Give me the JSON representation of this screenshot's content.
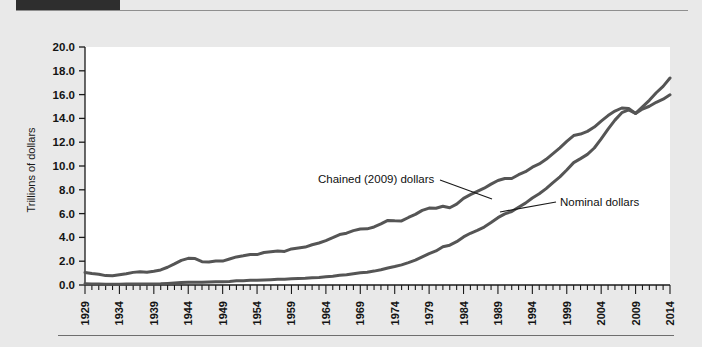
{
  "page": {
    "background_color": "#e9e9e9",
    "header_bar_color": "#2e2e2e",
    "rule_color": "#6e6e6e"
  },
  "chart_data": {
    "type": "line",
    "title": "",
    "subtitle": "",
    "xlabel": "",
    "ylabel": "Trillions of dollars",
    "xlim": [
      1929,
      2014
    ],
    "ylim": [
      0.0,
      20.0
    ],
    "ytick_step": 2.0,
    "xtick_step": 1,
    "xtick_label_step": 5,
    "grid": false,
    "legend_position": "inline-annotations",
    "plot_background": "#ffffff",
    "line_color": "#555555",
    "line_width": 3,
    "ytick_labels": [
      "0.0",
      "2.0",
      "4.0",
      "6.0",
      "8.0",
      "10.0",
      "12.0",
      "14.0",
      "16.0",
      "18.0",
      "20.0"
    ],
    "xtick_labels": [
      "1929",
      "1934",
      "1939",
      "1944",
      "1949",
      "1954",
      "1959",
      "1964",
      "1969",
      "1974",
      "1979",
      "1984",
      "1989",
      "1994",
      "1999",
      "2004",
      "2009",
      "2014"
    ],
    "annotations": [
      {
        "text": "Chained (2009) dollars",
        "x": 318,
        "y": 183,
        "leader": [
          [
            440,
            180
          ],
          [
            492,
            199
          ]
        ]
      },
      {
        "text": "Nominal dollars",
        "x": 560,
        "y": 206,
        "leader": [
          [
            556,
            202
          ],
          [
            500,
            212
          ]
        ]
      }
    ],
    "x": [
      1929,
      1930,
      1931,
      1932,
      1933,
      1934,
      1935,
      1936,
      1937,
      1938,
      1939,
      1940,
      1941,
      1942,
      1943,
      1944,
      1945,
      1946,
      1947,
      1948,
      1949,
      1950,
      1951,
      1952,
      1953,
      1954,
      1955,
      1956,
      1957,
      1958,
      1959,
      1960,
      1961,
      1962,
      1963,
      1964,
      1965,
      1966,
      1967,
      1968,
      1969,
      1970,
      1971,
      1972,
      1973,
      1974,
      1975,
      1976,
      1977,
      1978,
      1979,
      1980,
      1981,
      1982,
      1983,
      1984,
      1985,
      1986,
      1987,
      1988,
      1989,
      1990,
      1991,
      1992,
      1993,
      1994,
      1995,
      1996,
      1997,
      1998,
      1999,
      2000,
      2001,
      2002,
      2003,
      2004,
      2005,
      2006,
      2007,
      2008,
      2009,
      2010,
      2011,
      2012,
      2013,
      2014
    ],
    "series": [
      {
        "name": "Chained (2009) dollars",
        "values": [
          1.057,
          0.967,
          0.905,
          0.788,
          0.778,
          0.862,
          0.939,
          1.061,
          1.115,
          1.077,
          1.163,
          1.266,
          1.49,
          1.771,
          2.072,
          2.239,
          2.217,
          1.961,
          1.939,
          2.02,
          2.009,
          2.184,
          2.36,
          2.456,
          2.571,
          2.556,
          2.734,
          2.794,
          2.849,
          2.823,
          3.03,
          3.109,
          3.189,
          3.384,
          3.532,
          3.735,
          3.977,
          4.238,
          4.355,
          4.566,
          4.71,
          4.718,
          4.878,
          5.134,
          5.424,
          5.396,
          5.385,
          5.675,
          5.937,
          6.267,
          6.466,
          6.45,
          6.617,
          6.491,
          6.792,
          7.285,
          7.594,
          7.861,
          8.133,
          8.475,
          8.786,
          8.955,
          8.948,
          9.267,
          9.521,
          9.905,
          10.175,
          10.561,
          11.035,
          11.526,
          12.066,
          12.56,
          12.682,
          12.909,
          13.271,
          13.774,
          14.234,
          14.614,
          14.874,
          14.83,
          14.419,
          14.784,
          15.021,
          15.355,
          15.612,
          15.983
        ]
      },
      {
        "name": "Nominal dollars",
        "values": [
          0.105,
          0.092,
          0.077,
          0.06,
          0.057,
          0.067,
          0.074,
          0.085,
          0.093,
          0.087,
          0.093,
          0.103,
          0.129,
          0.166,
          0.203,
          0.224,
          0.228,
          0.228,
          0.25,
          0.275,
          0.273,
          0.3,
          0.347,
          0.367,
          0.389,
          0.391,
          0.426,
          0.45,
          0.474,
          0.482,
          0.522,
          0.543,
          0.563,
          0.605,
          0.639,
          0.686,
          0.744,
          0.815,
          0.862,
          0.943,
          1.02,
          1.076,
          1.168,
          1.282,
          1.429,
          1.549,
          1.689,
          1.878,
          2.086,
          2.357,
          2.632,
          2.863,
          3.211,
          3.345,
          3.638,
          4.041,
          4.347,
          4.59,
          4.87,
          5.253,
          5.658,
          5.98,
          6.174,
          6.539,
          6.879,
          7.309,
          7.664,
          8.1,
          8.609,
          9.089,
          9.661,
          10.285,
          10.622,
          10.978,
          11.511,
          12.275,
          13.094,
          13.856,
          14.478,
          14.719,
          14.419,
          14.964,
          15.518,
          16.155,
          16.692,
          17.393
        ]
      }
    ]
  }
}
